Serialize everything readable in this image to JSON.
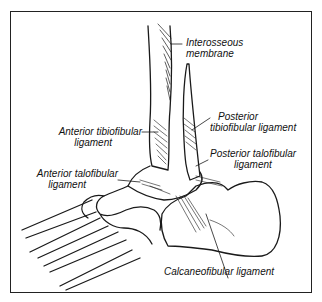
{
  "figure": {
    "labels": {
      "interosseous_membrane": [
        "Interosseous",
        "membrane"
      ],
      "posterior_tibiofibular": [
        "Posterior",
        "tibiofibular ligament"
      ],
      "anterior_tibiofibular": [
        "Anterior tibiofibular",
        "ligament"
      ],
      "posterior_talofibular": [
        "Posterior talofibular",
        "ligament"
      ],
      "anterior_talofibular": [
        "Anterior talofibular",
        "ligament"
      ],
      "calcaneofibular": [
        "Calcaneofibular ligament"
      ]
    },
    "colors": {
      "line": "#1a1a1a",
      "background": "#ffffff"
    }
  }
}
